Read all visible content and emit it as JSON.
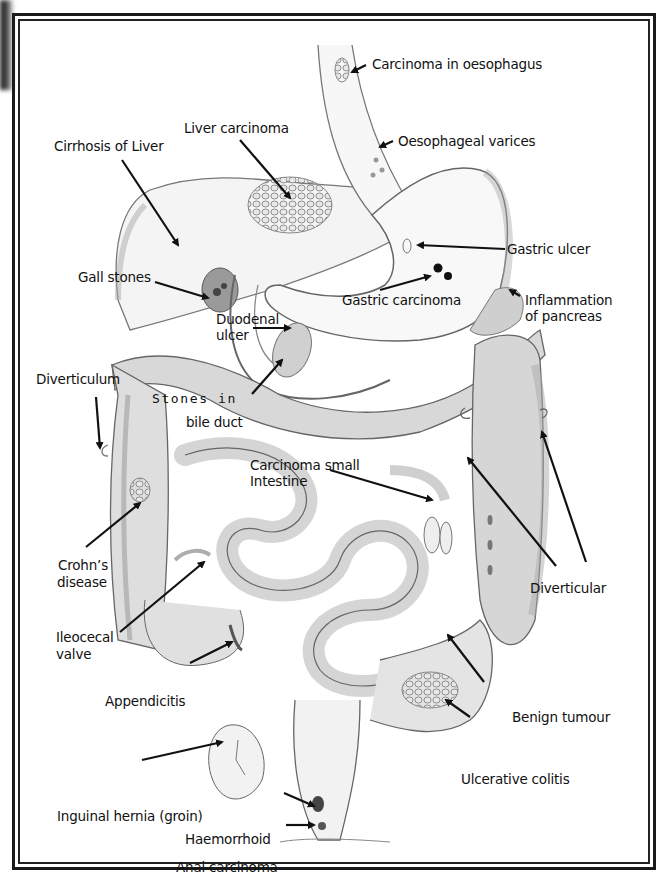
{
  "diagram": {
    "colors": {
      "ink": "#111111",
      "pencil": "#6a6a6a",
      "shade": "#bdbdbd",
      "frame": "#1a1a1a",
      "background": "#ffffff"
    },
    "labels": {
      "carcinoma_oesophagus": "Carcinoma in oesophagus",
      "oesophageal_varices": "Oesophageal varices",
      "liver_carcinoma": "Liver carcinoma",
      "cirrhosis_liver": "Cirrhosis of Liver",
      "gastric_ulcer": "Gastric ulcer",
      "gall_stones": "Gall stones",
      "gastric_carcinoma": "Gastric carcinoma",
      "inflammation_pancreas_1": "Inflammation",
      "inflammation_pancreas_2": "of pancreas",
      "duodenal_ulcer_1": "Duodenal",
      "duodenal_ulcer_2": "ulcer",
      "diverticulum": "Diverticulum",
      "stones_bile_duct_1": "Stones in",
      "stones_bile_duct_2": "bile duct",
      "carcinoma_small_intestine_1": "Carcinoma small",
      "carcinoma_small_intestine_2": "Intestine",
      "crohns_1": "Crohn’s",
      "crohns_2": "disease",
      "diverticular": "Diverticular",
      "ileocecal_1": "Ileocecal",
      "ileocecal_2": "valve",
      "appendicitis": "Appendicitis",
      "benign_tumour": "Benign tumour",
      "ulcerative_colitis": "Ulcerative colitis",
      "inguinal_hernia": "Inguinal hernia (groin)",
      "haemorrhoid": "Haemorrhoid",
      "anal_carcinoma": "Anal carcinoma"
    }
  }
}
